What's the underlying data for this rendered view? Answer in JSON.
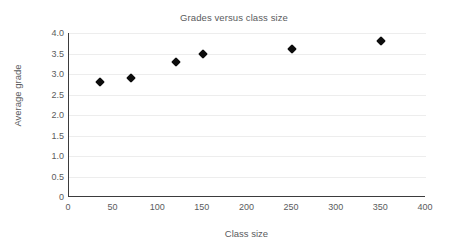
{
  "chart_data": {
    "type": "scatter",
    "title": "Grades versus class size",
    "xlabel": "Class size",
    "ylabel": "Average grade",
    "xlim": [
      0,
      400
    ],
    "ylim": [
      0,
      4.0
    ],
    "xticks": [
      "0",
      "50",
      "100",
      "150",
      "200",
      "250",
      "300",
      "350",
      "400"
    ],
    "xtick_values": [
      0,
      50,
      100,
      150,
      200,
      250,
      300,
      350,
      400
    ],
    "yticks": [
      "0",
      "0.5",
      "1.0",
      "1.5",
      "2.0",
      "2.5",
      "3.0",
      "3.5",
      "4.0"
    ],
    "ytick_values": [
      0,
      0.5,
      1.0,
      1.5,
      2.0,
      2.5,
      3.0,
      3.5,
      4.0
    ],
    "grid": "horizontal",
    "legend": null,
    "marker": "diamond",
    "marker_color": "#0d0d0d",
    "gridline_color": "#ededed",
    "axis_color": "#3b3b3d",
    "text_color": "#5a5b5d",
    "background_color": "#ffffff",
    "points": [
      {
        "x": 35,
        "y": 2.8
      },
      {
        "x": 70,
        "y": 2.9
      },
      {
        "x": 120,
        "y": 3.3
      },
      {
        "x": 150,
        "y": 3.5
      },
      {
        "x": 250,
        "y": 3.6
      },
      {
        "x": 350,
        "y": 3.8
      }
    ]
  }
}
